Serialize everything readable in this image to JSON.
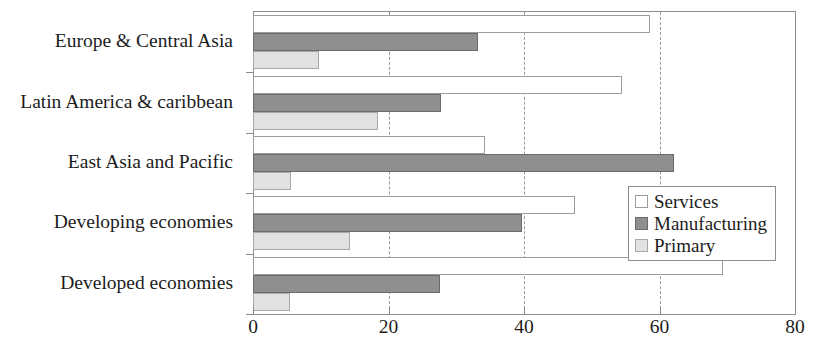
{
  "chart_data": {
    "type": "bar",
    "orientation": "horizontal",
    "title": "",
    "xlabel": "",
    "ylabel": "",
    "xlim": [
      0,
      80
    ],
    "xticks": [
      0,
      20,
      40,
      60,
      80
    ],
    "xtick_labels": [
      "0",
      "20",
      "40",
      "60",
      "80"
    ],
    "grid": "vertical-dashed-at-xticks",
    "legend_position": "middle-right-inside",
    "categories": [
      "Europe & Central Asia",
      "Latin America & caribbean",
      "East Asia and Pacific",
      "Developing economies",
      "Developed economies"
    ],
    "series": [
      {
        "name": "Services",
        "color": "#ffffff",
        "values": [
          58.6,
          54.5,
          34.2,
          47.5,
          69.3
        ]
      },
      {
        "name": "Manufacturing",
        "color": "#8f8f8f",
        "values": [
          33.2,
          27.8,
          62.2,
          39.7,
          27.6
        ]
      },
      {
        "name": "Primary",
        "color": "#e2e2e2",
        "values": [
          9.7,
          18.4,
          5.6,
          14.3,
          5.5
        ]
      }
    ]
  },
  "legend": {
    "items": [
      {
        "label": "Services",
        "key": "services"
      },
      {
        "label": "Manufacturing",
        "key": "manufacturing"
      },
      {
        "label": "Primary",
        "key": "primary"
      }
    ]
  }
}
